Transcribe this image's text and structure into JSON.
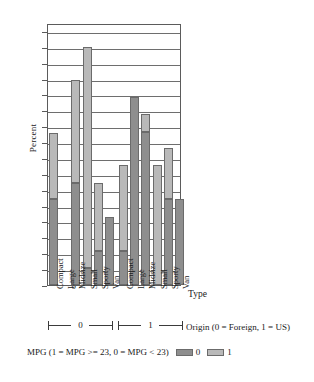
{
  "chart_data": {
    "type": "bar",
    "subtype": "stacked-grouped-bar",
    "title": "",
    "xlabel": "Type",
    "ylabel": "Percent",
    "ylim": [
      0,
      16.5
    ],
    "ytick_labels": [
      "0",
      "1",
      "2",
      "3",
      "4",
      "5",
      "6",
      "7",
      "8",
      "9",
      "10",
      "11",
      "12",
      "13",
      "14",
      "15",
      "16"
    ],
    "ytick_values": [
      0,
      1,
      2,
      3,
      4,
      5,
      6,
      7,
      8,
      9,
      10,
      11,
      12,
      13,
      14,
      15,
      16
    ],
    "grid": true,
    "grid_axis": "y",
    "legend_position": "bottom",
    "legend_title": "MPG (1 = MPG >= 23, 0 = MPG < 23)",
    "series": [
      {
        "name": "0",
        "color": "#8e8e8e"
      },
      {
        "name": "1",
        "color": "#b9b9b9"
      }
    ],
    "outer_group_label": "Origin (0 = Foreign, 1 = US)",
    "outer_groups": [
      "0",
      "1"
    ],
    "categories": [
      "Compact",
      "Large",
      "Midsize",
      "Small",
      "Sporty",
      "Van"
    ],
    "bars": [
      {
        "origin": "0",
        "type": "Compact",
        "seg0": 5.4,
        "seg1": 4.2,
        "total": 9.6
      },
      {
        "origin": "0",
        "type": "Large",
        "seg0": 0.0,
        "seg1": 0.0,
        "total": 0.0
      },
      {
        "origin": "0",
        "type": "Midsize",
        "seg0": 6.45,
        "seg1": 6.45,
        "total": 12.9
      },
      {
        "origin": "0",
        "type": "Small",
        "seg0": 1.05,
        "seg1": 13.95,
        "total": 15.0
      },
      {
        "origin": "0",
        "type": "Sporty",
        "seg0": 2.15,
        "seg1": 4.3,
        "total": 6.45
      },
      {
        "origin": "0",
        "type": "Van",
        "seg0": 4.3,
        "seg1": 0.0,
        "total": 4.3
      },
      {
        "origin": "1",
        "origin_label": "1",
        "type": "Compact",
        "seg0": 2.15,
        "seg1": 5.4,
        "total": 7.55
      },
      {
        "origin": "1",
        "type": "Large",
        "seg0": 11.85,
        "seg1": 0.0,
        "total": 11.85
      },
      {
        "origin": "1",
        "type": "Midsize",
        "seg0": 9.65,
        "seg1": 1.1,
        "total": 10.75
      },
      {
        "origin": "1",
        "type": "Small",
        "seg0": 0.0,
        "seg1": 7.55,
        "total": 7.55
      },
      {
        "origin": "1",
        "type": "Sporty",
        "seg0": 5.4,
        "seg1": 3.2,
        "total": 8.6
      },
      {
        "origin": "1",
        "type": "Van",
        "seg0": 5.4,
        "seg1": 0.0,
        "total": 5.4
      }
    ]
  }
}
